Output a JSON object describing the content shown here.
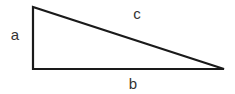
{
  "diagram": {
    "type": "right-triangle",
    "stroke_color": "#1a1a1a",
    "stroke_width": 2.2,
    "fill": "#ffffff",
    "vertices": {
      "top": [
        33,
        7
      ],
      "right_angle": [
        33,
        69
      ],
      "right": [
        224,
        69
      ]
    },
    "sides": [
      {
        "id": "a",
        "label": "a",
        "description": "vertical leg",
        "label_pos": [
          15,
          34
        ]
      },
      {
        "id": "b",
        "label": "b",
        "description": "horizontal leg",
        "label_pos": [
          133,
          83
        ]
      },
      {
        "id": "c",
        "label": "c",
        "description": "hypotenuse",
        "label_pos": [
          137,
          13
        ]
      }
    ],
    "label_color": "#333333"
  }
}
